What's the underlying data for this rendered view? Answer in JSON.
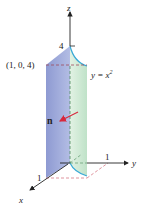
{
  "figure": {
    "axes": {
      "z_label": "z",
      "y_label": "y",
      "x_label": "x",
      "z_tick": "4",
      "y_tick": "1",
      "x_tick": "1"
    },
    "point_label": "(1, 0, 4)",
    "curve_label_prefix": "y = x",
    "curve_label_exp": "2",
    "normal_label": "n",
    "colors": {
      "blue_face": "#9aa6d6",
      "green_face": "#d4ecd8",
      "curve_edge": "#39a9d6",
      "normal_arrow": "#d8283c",
      "dashed_guides": "#d77a86"
    }
  }
}
